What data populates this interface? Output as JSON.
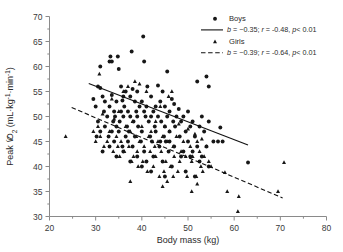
{
  "chart_data": {
    "type": "scatter",
    "title": "",
    "xlabel": "Body mass (kg)",
    "ylabel": "Peak VO2 (mL·kg-1·min-1)",
    "ylabel_parts": {
      "prefix": "Peak ",
      "v_dot": "V",
      "o": "O",
      "sub2": "2",
      "unit_open": " (mL·kg",
      "sup1": "-1",
      "mid": "·min",
      "sup2": "-1",
      "unit_close": ")"
    },
    "xlim": [
      20,
      80
    ],
    "ylim": [
      30,
      70
    ],
    "xticks": [
      20,
      30,
      40,
      50,
      60,
      70,
      80
    ],
    "yticks": [
      30,
      35,
      40,
      45,
      50,
      55,
      60,
      65,
      70
    ],
    "xminor_step": 5,
    "yminor_step": 2.5,
    "grid": false,
    "legend_position": "top-right",
    "series": [
      {
        "name": "Boys",
        "marker": "circle",
        "color": "#171717",
        "fit": {
          "style": "solid",
          "slope": -0.35,
          "r": -0.48,
          "p": "< 0.01",
          "label": "b = −0.35; r = -0.48, p< 0.01",
          "x_start": 28.5,
          "y_start": 56.6,
          "x_end": 63.0,
          "y_end": 44.3
        },
        "points": [
          [
            40.3,
            66.0
          ],
          [
            37.8,
            63.0
          ],
          [
            33.2,
            62.0
          ],
          [
            34.8,
            62.0
          ],
          [
            40.5,
            61.0
          ],
          [
            33.0,
            61.0
          ],
          [
            33.5,
            61.0
          ],
          [
            31.0,
            60.0
          ],
          [
            35.0,
            59.5
          ],
          [
            45.5,
            59.0
          ],
          [
            54.0,
            58.0
          ],
          [
            52.0,
            57.0
          ],
          [
            54.5,
            56.0
          ],
          [
            30.5,
            56.0
          ],
          [
            31.0,
            55.7
          ],
          [
            35.5,
            56.0
          ],
          [
            38.0,
            55.5
          ],
          [
            41.2,
            56.0
          ],
          [
            43.5,
            56.2
          ],
          [
            36.5,
            55.0
          ],
          [
            39.0,
            55.0
          ],
          [
            44.5,
            55.0
          ],
          [
            29.5,
            53.5
          ],
          [
            31.5,
            54.0
          ],
          [
            33.5,
            54.3
          ],
          [
            36.0,
            54.0
          ],
          [
            37.5,
            54.0
          ],
          [
            42.0,
            54.0
          ],
          [
            46.5,
            53.5
          ],
          [
            32.0,
            53.0
          ],
          [
            34.5,
            53.0
          ],
          [
            35.8,
            53.2
          ],
          [
            38.5,
            53.0
          ],
          [
            40.0,
            53.0
          ],
          [
            44.0,
            53.0
          ],
          [
            47.0,
            52.5
          ],
          [
            30.0,
            52.0
          ],
          [
            33.0,
            52.0
          ],
          [
            36.2,
            52.0
          ],
          [
            39.5,
            52.0
          ],
          [
            41.0,
            52.0
          ],
          [
            43.0,
            52.0
          ],
          [
            45.0,
            52.0
          ],
          [
            48.0,
            51.5
          ],
          [
            31.8,
            51.0
          ],
          [
            34.0,
            51.0
          ],
          [
            35.5,
            51.0
          ],
          [
            37.0,
            51.0
          ],
          [
            38.8,
            51.0
          ],
          [
            40.5,
            51.0
          ],
          [
            42.5,
            51.0
          ],
          [
            46.0,
            51.0
          ],
          [
            50.0,
            51.0
          ],
          [
            32.5,
            50.0
          ],
          [
            34.2,
            50.0
          ],
          [
            36.0,
            50.0
          ],
          [
            37.5,
            50.0
          ],
          [
            39.0,
            50.0
          ],
          [
            40.8,
            50.0
          ],
          [
            42.0,
            50.0
          ],
          [
            43.5,
            50.0
          ],
          [
            45.5,
            50.0
          ],
          [
            47.5,
            50.0
          ],
          [
            49.0,
            50.0
          ],
          [
            53.0,
            50.0
          ],
          [
            30.5,
            49.0
          ],
          [
            33.8,
            49.0
          ],
          [
            35.2,
            49.0
          ],
          [
            38.2,
            49.0
          ],
          [
            41.5,
            49.0
          ],
          [
            44.2,
            49.0
          ],
          [
            46.8,
            49.0
          ],
          [
            48.5,
            49.0
          ],
          [
            51.0,
            49.0
          ],
          [
            54.5,
            49.0
          ],
          [
            32.0,
            48.0
          ],
          [
            34.5,
            48.0
          ],
          [
            36.8,
            48.0
          ],
          [
            39.2,
            48.0
          ],
          [
            42.8,
            48.0
          ],
          [
            45.0,
            48.0
          ],
          [
            47.2,
            48.0
          ],
          [
            50.5,
            48.0
          ],
          [
            52.5,
            48.0
          ],
          [
            57.0,
            47.8
          ],
          [
            31.0,
            47.0
          ],
          [
            33.5,
            47.0
          ],
          [
            35.0,
            47.0
          ],
          [
            37.2,
            47.0
          ],
          [
            40.0,
            47.0
          ],
          [
            43.0,
            47.0
          ],
          [
            46.0,
            47.0
          ],
          [
            49.5,
            47.0
          ],
          [
            53.5,
            47.0
          ],
          [
            30.2,
            46.0
          ],
          [
            32.8,
            46.0
          ],
          [
            36.5,
            46.0
          ],
          [
            38.5,
            46.0
          ],
          [
            41.8,
            46.0
          ],
          [
            44.8,
            46.0
          ],
          [
            48.2,
            46.0
          ],
          [
            51.5,
            46.0
          ],
          [
            34.0,
            45.0
          ],
          [
            37.0,
            45.0
          ],
          [
            39.8,
            45.0
          ],
          [
            42.2,
            45.0
          ],
          [
            44.0,
            45.0
          ],
          [
            45.2,
            45.0
          ],
          [
            46.0,
            45.0
          ],
          [
            50.0,
            45.0
          ],
          [
            55.5,
            45.0
          ],
          [
            56.5,
            45.0
          ],
          [
            57.5,
            45.0
          ],
          [
            33.0,
            44.0
          ],
          [
            35.8,
            44.0
          ],
          [
            38.0,
            44.0
          ],
          [
            43.8,
            44.0
          ],
          [
            47.0,
            44.0
          ],
          [
            52.0,
            44.0
          ],
          [
            54.0,
            44.0
          ],
          [
            31.5,
            43.0
          ],
          [
            36.0,
            43.0
          ],
          [
            40.5,
            43.0
          ],
          [
            45.8,
            43.0
          ],
          [
            49.0,
            43.0
          ],
          [
            51.0,
            43.0
          ],
          [
            34.5,
            42.0
          ],
          [
            39.0,
            42.0
          ],
          [
            42.5,
            42.0
          ],
          [
            48.5,
            42.0
          ],
          [
            50.5,
            42.0
          ],
          [
            53.0,
            42.0
          ],
          [
            37.5,
            41.0
          ],
          [
            41.0,
            41.0
          ],
          [
            44.5,
            41.0
          ],
          [
            52.5,
            41.0
          ],
          [
            63.0,
            40.8
          ],
          [
            40.0,
            40.0
          ],
          [
            46.5,
            40.0
          ],
          [
            54.5,
            40.0
          ],
          [
            42.0,
            39.0
          ],
          [
            49.5,
            39.0
          ],
          [
            45.0,
            38.0
          ],
          [
            51.5,
            38.0
          ]
        ]
      },
      {
        "name": "Girls",
        "marker": "triangle",
        "color": "#171717",
        "fit": {
          "style": "dashed",
          "slope": -0.39,
          "r": -0.64,
          "p": "< 0.01",
          "label": "b = −0.39; r = -0.64, p< 0.01",
          "x_start": 24.8,
          "y_start": 51.8,
          "x_end": 70.5,
          "y_end": 33.7
        },
        "points": [
          [
            23.5,
            46.0
          ],
          [
            30.8,
            58.5
          ],
          [
            38.5,
            57.0
          ],
          [
            39.5,
            56.5
          ],
          [
            37.0,
            56.0
          ],
          [
            36.0,
            55.0
          ],
          [
            41.0,
            55.0
          ],
          [
            46.5,
            55.0
          ],
          [
            45.8,
            54.0
          ],
          [
            33.5,
            53.5
          ],
          [
            44.0,
            52.0
          ],
          [
            35.0,
            51.0
          ],
          [
            31.5,
            50.5
          ],
          [
            34.0,
            49.5
          ],
          [
            38.0,
            49.0
          ],
          [
            43.0,
            49.0
          ],
          [
            48.0,
            48.5
          ],
          [
            30.5,
            48.0
          ],
          [
            36.5,
            48.0
          ],
          [
            40.0,
            48.0
          ],
          [
            45.0,
            48.0
          ],
          [
            50.0,
            47.5
          ],
          [
            29.5,
            47.0
          ],
          [
            33.0,
            47.0
          ],
          [
            37.5,
            47.0
          ],
          [
            42.0,
            47.0
          ],
          [
            46.0,
            47.0
          ],
          [
            51.5,
            46.5
          ],
          [
            31.0,
            46.0
          ],
          [
            34.5,
            46.0
          ],
          [
            38.8,
            46.0
          ],
          [
            41.5,
            46.0
          ],
          [
            44.5,
            46.0
          ],
          [
            47.5,
            46.0
          ],
          [
            53.0,
            45.5
          ],
          [
            30.0,
            45.0
          ],
          [
            32.5,
            45.0
          ],
          [
            35.5,
            45.0
          ],
          [
            39.5,
            45.0
          ],
          [
            43.5,
            45.0
          ],
          [
            45.5,
            45.0
          ],
          [
            49.0,
            45.0
          ],
          [
            52.0,
            45.0
          ],
          [
            31.8,
            44.0
          ],
          [
            34.8,
            44.0
          ],
          [
            37.2,
            44.0
          ],
          [
            40.5,
            44.0
          ],
          [
            42.8,
            44.0
          ],
          [
            46.8,
            44.0
          ],
          [
            50.5,
            44.0
          ],
          [
            54.0,
            44.0
          ],
          [
            33.8,
            43.0
          ],
          [
            36.2,
            43.0
          ],
          [
            39.0,
            43.0
          ],
          [
            41.8,
            43.0
          ],
          [
            44.2,
            43.0
          ],
          [
            48.5,
            43.0
          ],
          [
            52.5,
            43.0
          ],
          [
            35.2,
            42.0
          ],
          [
            38.2,
            42.0
          ],
          [
            43.0,
            42.0
          ],
          [
            47.0,
            42.0
          ],
          [
            49.5,
            42.0
          ],
          [
            51.0,
            42.0
          ],
          [
            53.5,
            42.0
          ],
          [
            37.8,
            41.0
          ],
          [
            40.2,
            41.0
          ],
          [
            45.2,
            41.0
          ],
          [
            48.2,
            41.0
          ],
          [
            50.8,
            41.0
          ],
          [
            54.5,
            41.0
          ],
          [
            70.8,
            40.8
          ],
          [
            39.2,
            40.0
          ],
          [
            42.5,
            40.0
          ],
          [
            46.2,
            40.0
          ],
          [
            52.8,
            40.0
          ],
          [
            55.0,
            40.0
          ],
          [
            41.2,
            39.0
          ],
          [
            44.8,
            39.0
          ],
          [
            47.8,
            39.0
          ],
          [
            53.2,
            39.0
          ],
          [
            58.0,
            38.8
          ],
          [
            43.8,
            38.0
          ],
          [
            46.8,
            38.0
          ],
          [
            49.8,
            38.0
          ],
          [
            51.8,
            38.0
          ],
          [
            37.5,
            37.0
          ],
          [
            45.5,
            37.0
          ],
          [
            52.0,
            36.5
          ],
          [
            44.5,
            36.0
          ],
          [
            50.8,
            35.0
          ],
          [
            58.5,
            35.0
          ],
          [
            69.5,
            35.0
          ],
          [
            61.0,
            34.0
          ],
          [
            60.8,
            31.0
          ]
        ]
      }
    ],
    "legend_entries": [
      {
        "type": "marker",
        "marker": "circle",
        "label": "Boys"
      },
      {
        "type": "line",
        "style": "solid",
        "label": "b = −0.35; r = -0.48, p< 0.01"
      },
      {
        "type": "marker",
        "marker": "triangle",
        "label": "Girls"
      },
      {
        "type": "line",
        "style": "dashed",
        "label": "b = −0.39; r = -0.64, p< 0.01"
      }
    ]
  },
  "figure": {
    "xlabel": "Body mass (kg)",
    "series_names": {
      "boys": "Boys",
      "girls": "Girls"
    },
    "eq_boys": "b = −0.35; r = -0.48, p< 0.01",
    "eq_girls": "b = −0.39; r = -0.64, p< 0.01",
    "colors": {
      "marker": "#171717",
      "axis": "#8a8a8a",
      "text": "#2b2b2b"
    }
  }
}
